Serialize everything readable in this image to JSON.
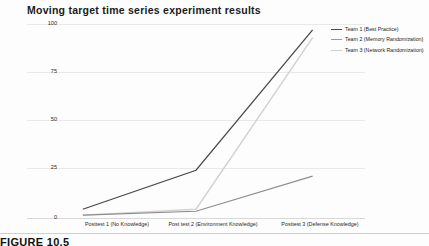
{
  "figure": {
    "caption": "FIGURE 10.5"
  },
  "chart_data": {
    "type": "line",
    "title": "Moving target time series experiment results",
    "xlabel": "",
    "ylabel": "",
    "categories": [
      "Posttest 1 (No Knowledge)",
      "Post test 2 (Environment Knowledge)",
      "Posttest 3 (Defense Knowledge)"
    ],
    "yticks": [
      "0",
      "25",
      "50",
      "75",
      "100"
    ],
    "ytick_values": [
      0,
      25,
      50,
      75,
      100
    ],
    "ylim": [
      0,
      100
    ],
    "grid": true,
    "legend_position": "right",
    "series": [
      {
        "name": "Team 1 (Best Practice)",
        "values": [
          5,
          25,
          97
        ],
        "color": "#4a4a4a"
      },
      {
        "name": "Team 2 (Memory Randomization)",
        "values": [
          2,
          4,
          22
        ],
        "color": "#8d8d8d"
      },
      {
        "name": "Team 3 (Network Randomization)",
        "values": [
          2,
          5,
          93
        ],
        "color": "#d2d2d2"
      }
    ]
  }
}
